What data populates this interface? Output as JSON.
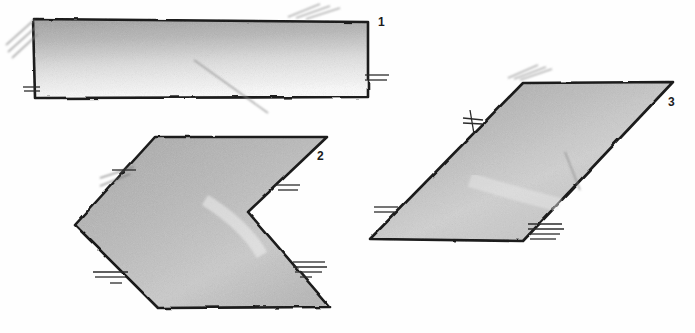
{
  "document": {
    "title": "Hand-drawn geometric shapes worksheet",
    "medium": "pencil sketch",
    "background_color": "#fefefe",
    "ink_color": "#1f1f1f",
    "shading_color": "#a9a9a9",
    "canvas": {
      "width": 695,
      "height": 333
    }
  },
  "shapes": [
    {
      "id": "shape-1",
      "label": "1",
      "name": "rectangle",
      "label_position": {
        "x": 378,
        "y": 26
      },
      "points": "33,19 368,22 368,97 35,98",
      "fill_gradient": "vertical-dark-top",
      "outline_color": "#1a1a1a",
      "hatch_marks": [
        {
          "type": "diagonal",
          "x1": 6,
          "y1": 45,
          "x2": 34,
          "y2": 20
        },
        {
          "type": "diagonal",
          "x1": 8,
          "y1": 52,
          "x2": 36,
          "y2": 27
        },
        {
          "type": "diagonal",
          "x1": 12,
          "y1": 58,
          "x2": 38,
          "y2": 34
        },
        {
          "type": "diagonal",
          "x1": 288,
          "y1": 17,
          "x2": 320,
          "y2": 4
        },
        {
          "type": "diagonal",
          "x1": 296,
          "y1": 18,
          "x2": 330,
          "y2": 6
        },
        {
          "type": "diagonal",
          "x1": 306,
          "y1": 19,
          "x2": 340,
          "y2": 8
        },
        {
          "type": "tick",
          "x1": 23,
          "y1": 87,
          "x2": 40,
          "y2": 87
        },
        {
          "type": "tick",
          "x1": 24,
          "y1": 91,
          "x2": 40,
          "y2": 91
        },
        {
          "type": "tick",
          "x1": 365,
          "y1": 75,
          "x2": 389,
          "y2": 75
        },
        {
          "type": "tick",
          "x1": 365,
          "y1": 80,
          "x2": 387,
          "y2": 80
        },
        {
          "type": "diagonal",
          "x1": 194,
          "y1": 60,
          "x2": 268,
          "y2": 113
        }
      ]
    },
    {
      "id": "shape-2",
      "label": "2",
      "name": "chevron-arrow-left",
      "label_position": {
        "x": 317,
        "y": 160
      },
      "points": "155,137 327,137 248,212 330,307 158,308 75,225",
      "fill_gradient": "diagonal-dark-upper-left",
      "outline_color": "#1a1a1a",
      "hatch_marks": [
        {
          "type": "tick",
          "x1": 112,
          "y1": 170,
          "x2": 136,
          "y2": 170
        },
        {
          "type": "diagonal",
          "x1": 100,
          "y1": 178,
          "x2": 134,
          "y2": 167
        },
        {
          "type": "diagonal",
          "x1": 100,
          "y1": 186,
          "x2": 130,
          "y2": 174
        },
        {
          "type": "tick",
          "x1": 93,
          "y1": 272,
          "x2": 128,
          "y2": 272
        },
        {
          "type": "tick",
          "x1": 95,
          "y1": 277,
          "x2": 126,
          "y2": 277
        },
        {
          "type": "tick",
          "x1": 110,
          "y1": 283,
          "x2": 122,
          "y2": 283
        },
        {
          "type": "tick",
          "x1": 275,
          "y1": 185,
          "x2": 300,
          "y2": 185
        },
        {
          "type": "tick",
          "x1": 278,
          "y1": 190,
          "x2": 298,
          "y2": 190
        },
        {
          "type": "tick",
          "x1": 293,
          "y1": 262,
          "x2": 325,
          "y2": 262
        },
        {
          "type": "tick",
          "x1": 293,
          "y1": 267,
          "x2": 327,
          "y2": 267
        },
        {
          "type": "tick",
          "x1": 295,
          "y1": 272,
          "x2": 322,
          "y2": 272
        },
        {
          "type": "tick",
          "x1": 300,
          "y1": 277,
          "x2": 312,
          "y2": 277
        }
      ]
    },
    {
      "id": "shape-3",
      "label": "3",
      "name": "parallelogram",
      "label_position": {
        "x": 668,
        "y": 106
      },
      "points": "523,83 673,82 523,241 370,239",
      "fill_gradient": "diagonal-dark-upper-left",
      "outline_color": "#1a1a1a",
      "hatch_marks": [
        {
          "type": "diagonal",
          "x1": 508,
          "y1": 78,
          "x2": 538,
          "y2": 65
        },
        {
          "type": "diagonal",
          "x1": 514,
          "y1": 79,
          "x2": 546,
          "y2": 67
        },
        {
          "type": "diagonal",
          "x1": 520,
          "y1": 80,
          "x2": 552,
          "y2": 69
        },
        {
          "type": "cross",
          "x1": 470,
          "y1": 110,
          "x2": 474,
          "y2": 134
        },
        {
          "type": "tick",
          "x1": 463,
          "y1": 118,
          "x2": 483,
          "y2": 120
        },
        {
          "type": "tick",
          "x1": 463,
          "y1": 123,
          "x2": 482,
          "y2": 124
        },
        {
          "type": "tick",
          "x1": 374,
          "y1": 207,
          "x2": 398,
          "y2": 207
        },
        {
          "type": "tick",
          "x1": 374,
          "y1": 212,
          "x2": 396,
          "y2": 212
        },
        {
          "type": "tick",
          "x1": 528,
          "y1": 224,
          "x2": 562,
          "y2": 224
        },
        {
          "type": "tick",
          "x1": 528,
          "y1": 229,
          "x2": 564,
          "y2": 229
        },
        {
          "type": "tick",
          "x1": 528,
          "y1": 234,
          "x2": 560,
          "y2": 234
        },
        {
          "type": "tick",
          "x1": 530,
          "y1": 239,
          "x2": 556,
          "y2": 239
        },
        {
          "type": "cross",
          "x1": 565,
          "y1": 152,
          "x2": 580,
          "y2": 190
        }
      ]
    }
  ]
}
